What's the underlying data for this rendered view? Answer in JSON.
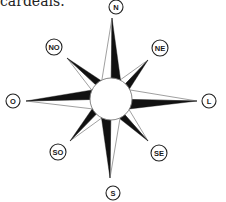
{
  "caption": "cardeais.",
  "compass": {
    "center": {
      "x": 111,
      "y": 99,
      "r": 21
    },
    "colors": {
      "ink": "#111111",
      "fill_dark": "#111111",
      "fill_light": "#ffffff",
      "stroke": "#777777"
    },
    "directions": [
      {
        "key": "N",
        "label": "N",
        "type": "cardinal",
        "label_pos": {
          "x": 116,
          "y": 7
        },
        "tip": {
          "x": 112,
          "y": 18
        }
      },
      {
        "key": "NE",
        "label": "NE",
        "type": "intercardinal",
        "label_pos": {
          "x": 160,
          "y": 48
        },
        "tip": {
          "x": 148,
          "y": 60
        }
      },
      {
        "key": "L",
        "label": "L",
        "type": "cardinal",
        "label_pos": {
          "x": 209,
          "y": 101
        },
        "tip": {
          "x": 197,
          "y": 101
        }
      },
      {
        "key": "SE",
        "label": "SE",
        "type": "intercardinal",
        "label_pos": {
          "x": 159,
          "y": 153
        },
        "tip": {
          "x": 148,
          "y": 141
        }
      },
      {
        "key": "S",
        "label": "S",
        "type": "cardinal",
        "label_pos": {
          "x": 113,
          "y": 193
        },
        "tip": {
          "x": 110,
          "y": 178
        }
      },
      {
        "key": "SO",
        "label": "SO",
        "type": "intercardinal",
        "label_pos": {
          "x": 58,
          "y": 152
        },
        "tip": {
          "x": 70,
          "y": 141
        }
      },
      {
        "key": "O",
        "label": "O",
        "type": "cardinal",
        "label_pos": {
          "x": 13,
          "y": 101
        },
        "tip": {
          "x": 26,
          "y": 101
        }
      },
      {
        "key": "NO",
        "label": "NO",
        "type": "intercardinal",
        "label_pos": {
          "x": 54,
          "y": 47
        },
        "tip": {
          "x": 67,
          "y": 58
        }
      }
    ]
  }
}
